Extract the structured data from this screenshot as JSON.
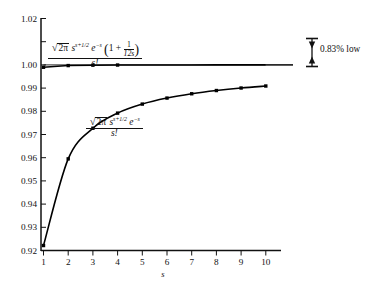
{
  "chart_data": {
    "type": "line",
    "title": "",
    "subtitle": "",
    "xlabel": "s",
    "ylabel": "",
    "xlim": [
      1,
      10.6
    ],
    "ylim": [
      0.92,
      1.02
    ],
    "xticks": [
      1,
      2,
      3,
      4,
      5,
      6,
      7,
      8,
      9,
      10
    ],
    "xticklabels": [
      "1",
      "2",
      "3",
      "4",
      "5",
      "6",
      "7",
      "8",
      "9",
      "10"
    ],
    "yticks": [
      0.92,
      0.93,
      0.94,
      0.95,
      0.96,
      0.97,
      0.98,
      0.99,
      1.0,
      1.01,
      1.02
    ],
    "yticklabels": [
      "0.92",
      "0.93",
      "0.94",
      "0.95",
      "0.96",
      "0.97",
      "0.98",
      "0.99",
      "1.00",
      "",
      "1.02"
    ],
    "grid": false,
    "legend_position": "inline-annotations",
    "x": [
      1,
      2,
      3,
      4,
      5,
      6,
      7,
      8,
      9,
      10
    ],
    "series": [
      {
        "name": "sqrt(2*pi) s^(s+1/2) e^-s (1 + 1/(12s)) / s!",
        "values": [
          0.99898,
          0.99971,
          0.99988,
          0.99994,
          0.99996,
          0.99998,
          0.99998,
          0.99999,
          0.99999,
          0.99999
        ],
        "markers": true
      },
      {
        "name": "sqrt(2*pi) s^(s+1/2) e^-s / s!",
        "values": [
          0.92214,
          0.9595,
          0.9727,
          0.97921,
          0.98311,
          0.9857,
          0.98756,
          0.98895,
          0.99004,
          0.9909
        ],
        "markers": true
      }
    ],
    "annotations": [
      {
        "name": "error-bar-note",
        "text": "0.83% low",
        "marker": "double-arrow-vertical"
      }
    ]
  },
  "axis": {
    "x_title": "s",
    "yticklabels": [
      "1.02",
      "1.00",
      "0.99",
      "0.98",
      "0.97",
      "0.96",
      "0.95",
      "0.94",
      "0.93",
      "0.92"
    ],
    "xticklabels": [
      "1",
      "2",
      "3",
      "4",
      "5",
      "6",
      "7",
      "8",
      "9",
      "10"
    ]
  },
  "formula_top": {
    "radical_symbol": "√",
    "radicand": "2π",
    "base": "s",
    "exponent": "s+1/2",
    "exp_factor": "e",
    "exp_factor_power": "−s",
    "paren_open": "(",
    "one": "1",
    "plus": "+",
    "frac_num": "1",
    "frac_den": "12s",
    "paren_close": ")",
    "denominator": "s!"
  },
  "formula_bottom": {
    "radical_symbol": "√",
    "radicand": "2π",
    "base": "s",
    "exponent": "s+1/2",
    "exp_factor": "e",
    "exp_factor_power": "−s",
    "denominator": "s!"
  },
  "low_note": {
    "label": "0.83% low"
  },
  "colors": {
    "ink": "#111111",
    "background": "#ffffff",
    "curve": "#000000"
  }
}
